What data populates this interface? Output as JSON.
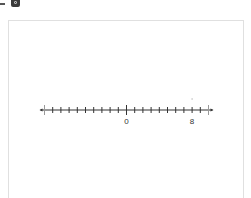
{
  "toolbar": {
    "icons": [
      "dash-icon",
      "toolbar-button-icon"
    ]
  },
  "number_line": {
    "min": -10,
    "max": 10,
    "step": 1,
    "labels": [
      {
        "value": 0,
        "text": "0"
      },
      {
        "value": 8,
        "text": "8"
      }
    ],
    "major_ticks": [
      -10,
      0,
      10
    ],
    "marked_point": 8,
    "line_color": "#333333",
    "end_tick_color": "#999999"
  }
}
